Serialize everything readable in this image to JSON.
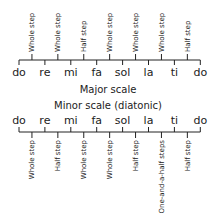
{
  "major": {
    "title": "Major scale",
    "notes": [
      "do",
      "re",
      "mi",
      "fa",
      "sol",
      "la",
      "ti",
      "do"
    ],
    "steps": [
      "Whole step",
      "Whole step",
      "Half step",
      "Whole step",
      "Whole step",
      "Whole step",
      "Half step"
    ]
  },
  "minor": {
    "title": "Minor scale (diatonic)",
    "notes": [
      "do",
      "re",
      "mi",
      "fa",
      "sol",
      "la",
      "ti",
      "do"
    ],
    "steps": [
      "Whole step",
      "Half step",
      "Whole step",
      "Whole step",
      "Half step",
      "One-and-a-half steps",
      "Half step"
    ]
  },
  "colors": {
    "ink": "#222222"
  }
}
